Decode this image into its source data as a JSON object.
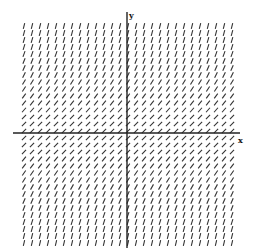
{
  "diagram": {
    "type": "slope_field",
    "axes": {
      "x_label": "x",
      "y_label": "y",
      "origin_px": [
        127,
        133
      ],
      "x_axis_px": [
        13,
        240
      ],
      "y_axis_px": [
        12,
        248
      ],
      "color": "#222222"
    },
    "grid": {
      "x_start_px": 24,
      "x_end_px": 232,
      "x_step_px": 8,
      "y_start_px": 26,
      "y_end_px": 246,
      "y_step_px": 7,
      "segment_length_px": 6,
      "scale_px_per_unit": 60,
      "segment_color": "#333333"
    },
    "equation_hint": "dy/dx = 1 + y^2"
  }
}
